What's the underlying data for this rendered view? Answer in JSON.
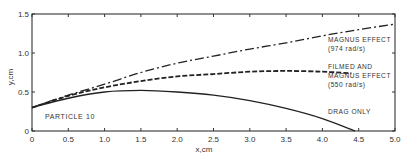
{
  "chart_data": {
    "type": "line",
    "title": "",
    "xlabel": "x,cm",
    "ylabel": "y,cm",
    "xlim": [
      0,
      5.0
    ],
    "ylim": [
      0,
      1.5
    ],
    "grid": false,
    "x_ticks": [
      "0",
      "0.5",
      "1.0",
      "1.5",
      "2.0",
      "2.5",
      "3.0",
      "3.5",
      "4.0",
      "4.5",
      "5.0"
    ],
    "y_ticks": [
      "0",
      "0.5",
      "1.0",
      "1.5"
    ],
    "annotation": "PARTICLE 10",
    "series": [
      {
        "name": "MAGNUS EFFECT (974 rad/s)",
        "label_lines": [
          "MAGNUS EFFECT",
          "(974 rad/s)"
        ],
        "style": "dash-dot",
        "x": [
          0,
          0.5,
          1.0,
          1.5,
          2.0,
          2.5,
          3.0,
          3.5,
          4.0,
          4.5,
          5.0
        ],
        "y": [
          0.3,
          0.46,
          0.6,
          0.75,
          0.87,
          0.96,
          1.05,
          1.13,
          1.22,
          1.3,
          1.37
        ]
      },
      {
        "name": "FILMED AND MAGNUS EFFECT (550 rad/s)",
        "label_lines": [
          "FILMED AND",
          "MAGNUS EFFECT",
          "(550 rad/s)"
        ],
        "style": "dashed-filmed",
        "x": [
          0,
          0.5,
          1.0,
          1.5,
          2.0,
          2.5,
          3.0,
          3.5,
          4.0,
          4.4
        ],
        "y": [
          0.3,
          0.45,
          0.56,
          0.64,
          0.7,
          0.73,
          0.76,
          0.77,
          0.76,
          0.74
        ]
      },
      {
        "name": "DRAG ONLY",
        "label_lines": [
          "DRAG ONLY"
        ],
        "style": "solid",
        "x": [
          0,
          0.5,
          1.0,
          1.5,
          2.0,
          2.5,
          3.0,
          3.5,
          4.0,
          4.45
        ],
        "y": [
          0.3,
          0.42,
          0.5,
          0.52,
          0.5,
          0.46,
          0.39,
          0.29,
          0.16,
          0.0
        ]
      }
    ]
  },
  "labels": {
    "xlabel": "x,cm",
    "ylabel": "y,cm",
    "annotation": "PARTICLE 10"
  }
}
